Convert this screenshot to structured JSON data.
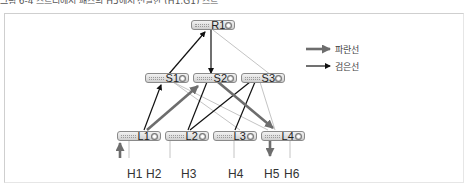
{
  "caption": "그림 6-4 스트리에서 패스의 H5에서 전달한 (H1,G1) 스트",
  "legend": {
    "items": [
      {
        "label": "파란선",
        "style": "thick-gray-arrow",
        "color": "#6d6d6d"
      },
      {
        "label": "검은선",
        "style": "thin-black-arrow",
        "color": "#111111"
      }
    ]
  },
  "nodes": {
    "R1": {
      "label": "R1"
    },
    "S1": {
      "label": "S1"
    },
    "S2": {
      "label": "S2"
    },
    "S3": {
      "label": "S3"
    },
    "L1": {
      "label": "L1"
    },
    "L2": {
      "label": "L2"
    },
    "L3": {
      "label": "L3"
    },
    "L4": {
      "label": "L4"
    }
  },
  "hosts": {
    "H1": "H1",
    "H2": "H2",
    "H3": "H3",
    "H4": "H4",
    "H5": "H5",
    "H6": "H6"
  },
  "edges": [
    {
      "from": "S1",
      "to": "R1",
      "style": "black-arrow"
    },
    {
      "from": "R1",
      "to": "S2",
      "style": "black-arrow"
    },
    {
      "from": "R1",
      "to": "S3",
      "style": "light"
    },
    {
      "from": "L1",
      "to": "S1",
      "style": "black-arrow"
    },
    {
      "from": "L1",
      "to": "S2",
      "style": "gray-arrow"
    },
    {
      "from": "S1",
      "to": "L3",
      "style": "light"
    },
    {
      "from": "S1",
      "to": "L4",
      "style": "light"
    },
    {
      "from": "S2",
      "to": "L2",
      "style": "black"
    },
    {
      "from": "S2",
      "to": "L4",
      "style": "gray-arrow"
    },
    {
      "from": "S3",
      "to": "L2",
      "style": "black"
    },
    {
      "from": "S3",
      "to": "L3",
      "style": "black"
    },
    {
      "from": "S3",
      "to": "L4",
      "style": "light"
    },
    {
      "from": "H1",
      "to": "L1",
      "style": "gray-arrow"
    },
    {
      "from": "L1",
      "to": "H2",
      "style": "light"
    },
    {
      "from": "L2",
      "to": "H3",
      "style": "light"
    },
    {
      "from": "L3",
      "to": "H4",
      "style": "light"
    },
    {
      "from": "L4",
      "to": "H5",
      "style": "gray-arrow"
    },
    {
      "from": "L4",
      "to": "H6",
      "style": "light"
    }
  ]
}
